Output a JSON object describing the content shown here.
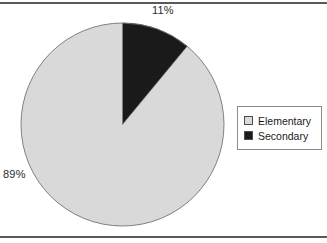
{
  "figure": {
    "background_color": "#ffffff",
    "rule_color": "#595959",
    "top_rule": "horizontal-rule",
    "bottom_rule": "horizontal-rule"
  },
  "labels": {
    "secondary_pct": "11%",
    "elementary_pct": "89%"
  },
  "legend": {
    "border_color": "#8c8c8c",
    "items": [
      {
        "label": "Elementary",
        "color": "#d9d9d9",
        "swatch_name": "elementary-swatch"
      },
      {
        "label": "Secondary",
        "color": "#1a1a1a",
        "swatch_name": "secondary-swatch"
      }
    ]
  },
  "chart_data": {
    "type": "pie",
    "title": "",
    "categories": [
      "Elementary",
      "Secondary"
    ],
    "values": [
      89,
      11
    ],
    "value_unit": "percent",
    "data_labels": [
      "89%",
      "11%"
    ],
    "colors": [
      "#d9d9d9",
      "#1a1a1a"
    ],
    "slice_edge_color": "#808080",
    "start_angle_deg": 90,
    "direction": "clockwise",
    "legend_entries": [
      "Elementary",
      "Secondary"
    ],
    "legend_position": "right",
    "grid": false,
    "xlabel": "",
    "ylabel": "",
    "geometry": {
      "center_x": 102.5,
      "center_y": 102.5,
      "radius": 101.5
    }
  }
}
